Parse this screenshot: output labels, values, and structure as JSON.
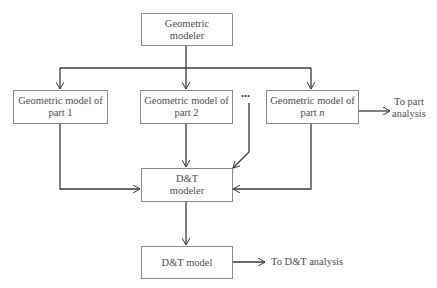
{
  "diagram": {
    "nodes": {
      "geometric_modeler": {
        "line1": "Geometric",
        "line2": "modeler"
      },
      "part1": {
        "line1": "Geometric model of",
        "line2": "part 1"
      },
      "part2": {
        "line1": "Geometric model of",
        "line2": "part 2"
      },
      "partn": {
        "line1": "Geometric model of",
        "line2_prefix": "part ",
        "line2_var": "n"
      },
      "dt_modeler": {
        "line1": "D&T",
        "line2": "modeler"
      },
      "dt_model": {
        "line1": "D&T model"
      }
    },
    "ellipsis": "...",
    "outputs": {
      "to_part_analysis": {
        "line1": "To part",
        "line2": "analysis"
      },
      "to_dt_analysis": "To D&T analysis"
    },
    "edges": [
      {
        "from": "geometric_modeler",
        "to": "part1"
      },
      {
        "from": "geometric_modeler",
        "to": "part2"
      },
      {
        "from": "geometric_modeler",
        "to": "partn"
      },
      {
        "from": "part1",
        "to": "dt_modeler"
      },
      {
        "from": "part2",
        "to": "dt_modeler"
      },
      {
        "from": "ellipsis",
        "to": "dt_modeler"
      },
      {
        "from": "partn",
        "to": "dt_modeler"
      },
      {
        "from": "partn",
        "to": "to_part_analysis"
      },
      {
        "from": "dt_modeler",
        "to": "dt_model"
      },
      {
        "from": "dt_model",
        "to": "to_dt_analysis"
      }
    ],
    "colors": {
      "line": "#3a3a3a",
      "box_border": "#8a8a8a",
      "text": "#4e4e4e"
    }
  }
}
